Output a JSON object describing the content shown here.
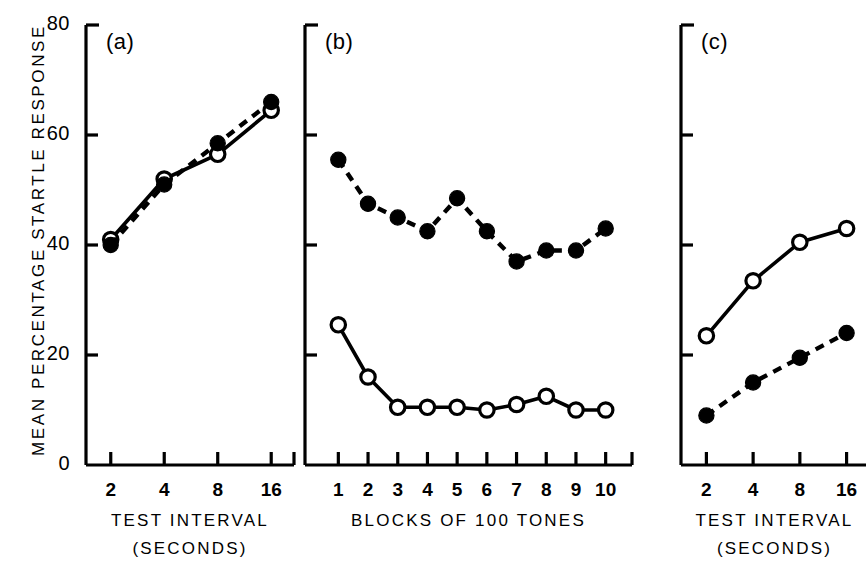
{
  "figure": {
    "y_axis_label": "MEAN PERCENTAGE STARTLE RESPONSE",
    "y_ticks": [
      "0",
      "20",
      "40",
      "60",
      "80"
    ],
    "panels": [
      {
        "tag": "(a)",
        "x_title": "TEST INTERVAL",
        "x_subtitle": "(SECONDS)",
        "x_ticks": [
          "2",
          "4",
          "8",
          "16"
        ]
      },
      {
        "tag": "(b)",
        "x_title": "BLOCKS OF 100 TONES",
        "x_subtitle": "",
        "x_ticks": [
          "1",
          "2",
          "3",
          "4",
          "5",
          "6",
          "7",
          "8",
          "9",
          "10"
        ]
      },
      {
        "tag": "(c)",
        "x_title": "TEST INTERVAL",
        "x_subtitle": "(SECONDS)",
        "x_ticks": [
          "2",
          "4",
          "8",
          "16"
        ]
      }
    ]
  },
  "chart_data": [
    {
      "type": "line",
      "panel": "(a)",
      "title": "",
      "xlabel": "TEST INTERVAL (SECONDS)",
      "ylabel": "MEAN PERCENTAGE STARTLE RESPONSE",
      "x": [
        2,
        4,
        8,
        16
      ],
      "x_scale": "log2",
      "xlim": [
        1.74,
        18.4
      ],
      "ylim": [
        0,
        80
      ],
      "y_ticks": [
        0,
        20,
        40,
        60,
        80
      ],
      "grid": false,
      "legend": "none",
      "series": [
        {
          "name": "open-circle-solid",
          "marker": "open-circle",
          "line": "solid",
          "values": [
            41,
            52,
            56.5,
            64.5
          ]
        },
        {
          "name": "filled-circle-dashed",
          "marker": "filled-circle",
          "line": "dashed",
          "values": [
            40,
            51,
            58.5,
            66
          ]
        }
      ]
    },
    {
      "type": "line",
      "panel": "(b)",
      "title": "",
      "xlabel": "BLOCKS OF 100 TONES",
      "ylabel": "MEAN PERCENTAGE STARTLE RESPONSE",
      "x": [
        1,
        2,
        3,
        4,
        5,
        6,
        7,
        8,
        9,
        10
      ],
      "x_scale": "linear",
      "xlim": [
        0.45,
        10.55
      ],
      "ylim": [
        0,
        80
      ],
      "y_ticks": [
        0,
        20,
        40,
        60,
        80
      ],
      "grid": false,
      "legend": "none",
      "series": [
        {
          "name": "filled-circle-dashed",
          "marker": "filled-circle",
          "line": "dashed",
          "values": [
            55.5,
            47.5,
            45,
            42.5,
            48.5,
            42.5,
            37,
            39,
            39,
            43
          ]
        },
        {
          "name": "open-circle-solid",
          "marker": "open-circle",
          "line": "solid",
          "values": [
            25.5,
            16,
            10.5,
            10.5,
            10.5,
            10,
            11,
            12.5,
            10,
            10
          ]
        }
      ]
    },
    {
      "type": "line",
      "panel": "(c)",
      "title": "",
      "xlabel": "TEST INTERVAL (SECONDS)",
      "ylabel": "MEAN PERCENTAGE STARTLE RESPONSE",
      "x": [
        2,
        4,
        8,
        16
      ],
      "x_scale": "log2",
      "xlim": [
        1.74,
        18.4
      ],
      "ylim": [
        0,
        80
      ],
      "y_ticks": [
        0,
        20,
        40,
        60,
        80
      ],
      "grid": false,
      "legend": "none",
      "series": [
        {
          "name": "open-circle-solid",
          "marker": "open-circle",
          "line": "solid",
          "values": [
            23.5,
            33.5,
            40.5,
            43
          ]
        },
        {
          "name": "filled-circle-dashed",
          "marker": "filled-circle",
          "line": "dashed",
          "values": [
            9,
            15,
            19.5,
            24
          ]
        }
      ]
    }
  ]
}
